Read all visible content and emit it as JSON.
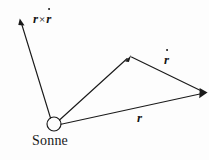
{
  "figure": {
    "width": 209,
    "height": 160,
    "background_color": "#fdfdfd",
    "stroke_color": "#1a1a1a",
    "caption": "Sonne",
    "labels": {
      "cross_product_r": "r",
      "cross_product_operator": "×",
      "cross_product_rdot": "r",
      "velocity_vector": "r",
      "position_vector": "r",
      "origin_caption": "Sonne"
    },
    "geometry": {
      "origin_circle": {
        "cx": 54,
        "cy": 124,
        "r": 7
      },
      "vectors": [
        {
          "name": "angular-momentum-vector",
          "label": "r × ṙ",
          "from": [
            50,
            118
          ],
          "to": [
            20,
            20
          ]
        },
        {
          "name": "position-vector",
          "label": "r",
          "from": [
            61,
            124
          ],
          "to": [
            207,
            93
          ]
        },
        {
          "name": "radius-to-apex-vector",
          "label": "",
          "from": [
            59,
            120
          ],
          "to": [
            130,
            56
          ]
        },
        {
          "name": "velocity-vector",
          "label": "ṙ",
          "from": [
            130,
            56
          ],
          "to": [
            207,
            93
          ]
        }
      ]
    }
  }
}
